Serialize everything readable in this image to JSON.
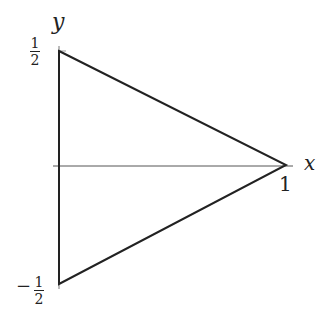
{
  "diagram": {
    "type": "triangle-region",
    "axes": {
      "x_label": "x",
      "y_label": "y"
    },
    "ticks": {
      "y_top": {
        "numerator": "1",
        "denominator": "2",
        "sign": ""
      },
      "y_bottom": {
        "numerator": "1",
        "denominator": "2",
        "sign": "−"
      },
      "x_right": "1"
    },
    "vertices": [
      {
        "name": "top",
        "x": 0,
        "y": 0.5
      },
      {
        "name": "apex",
        "x": 1,
        "y": 0
      },
      {
        "name": "bottom",
        "x": 0,
        "y": -0.5
      }
    ],
    "colors": {
      "stroke": "#222222",
      "axis": "#555555",
      "background": "#ffffff"
    }
  }
}
